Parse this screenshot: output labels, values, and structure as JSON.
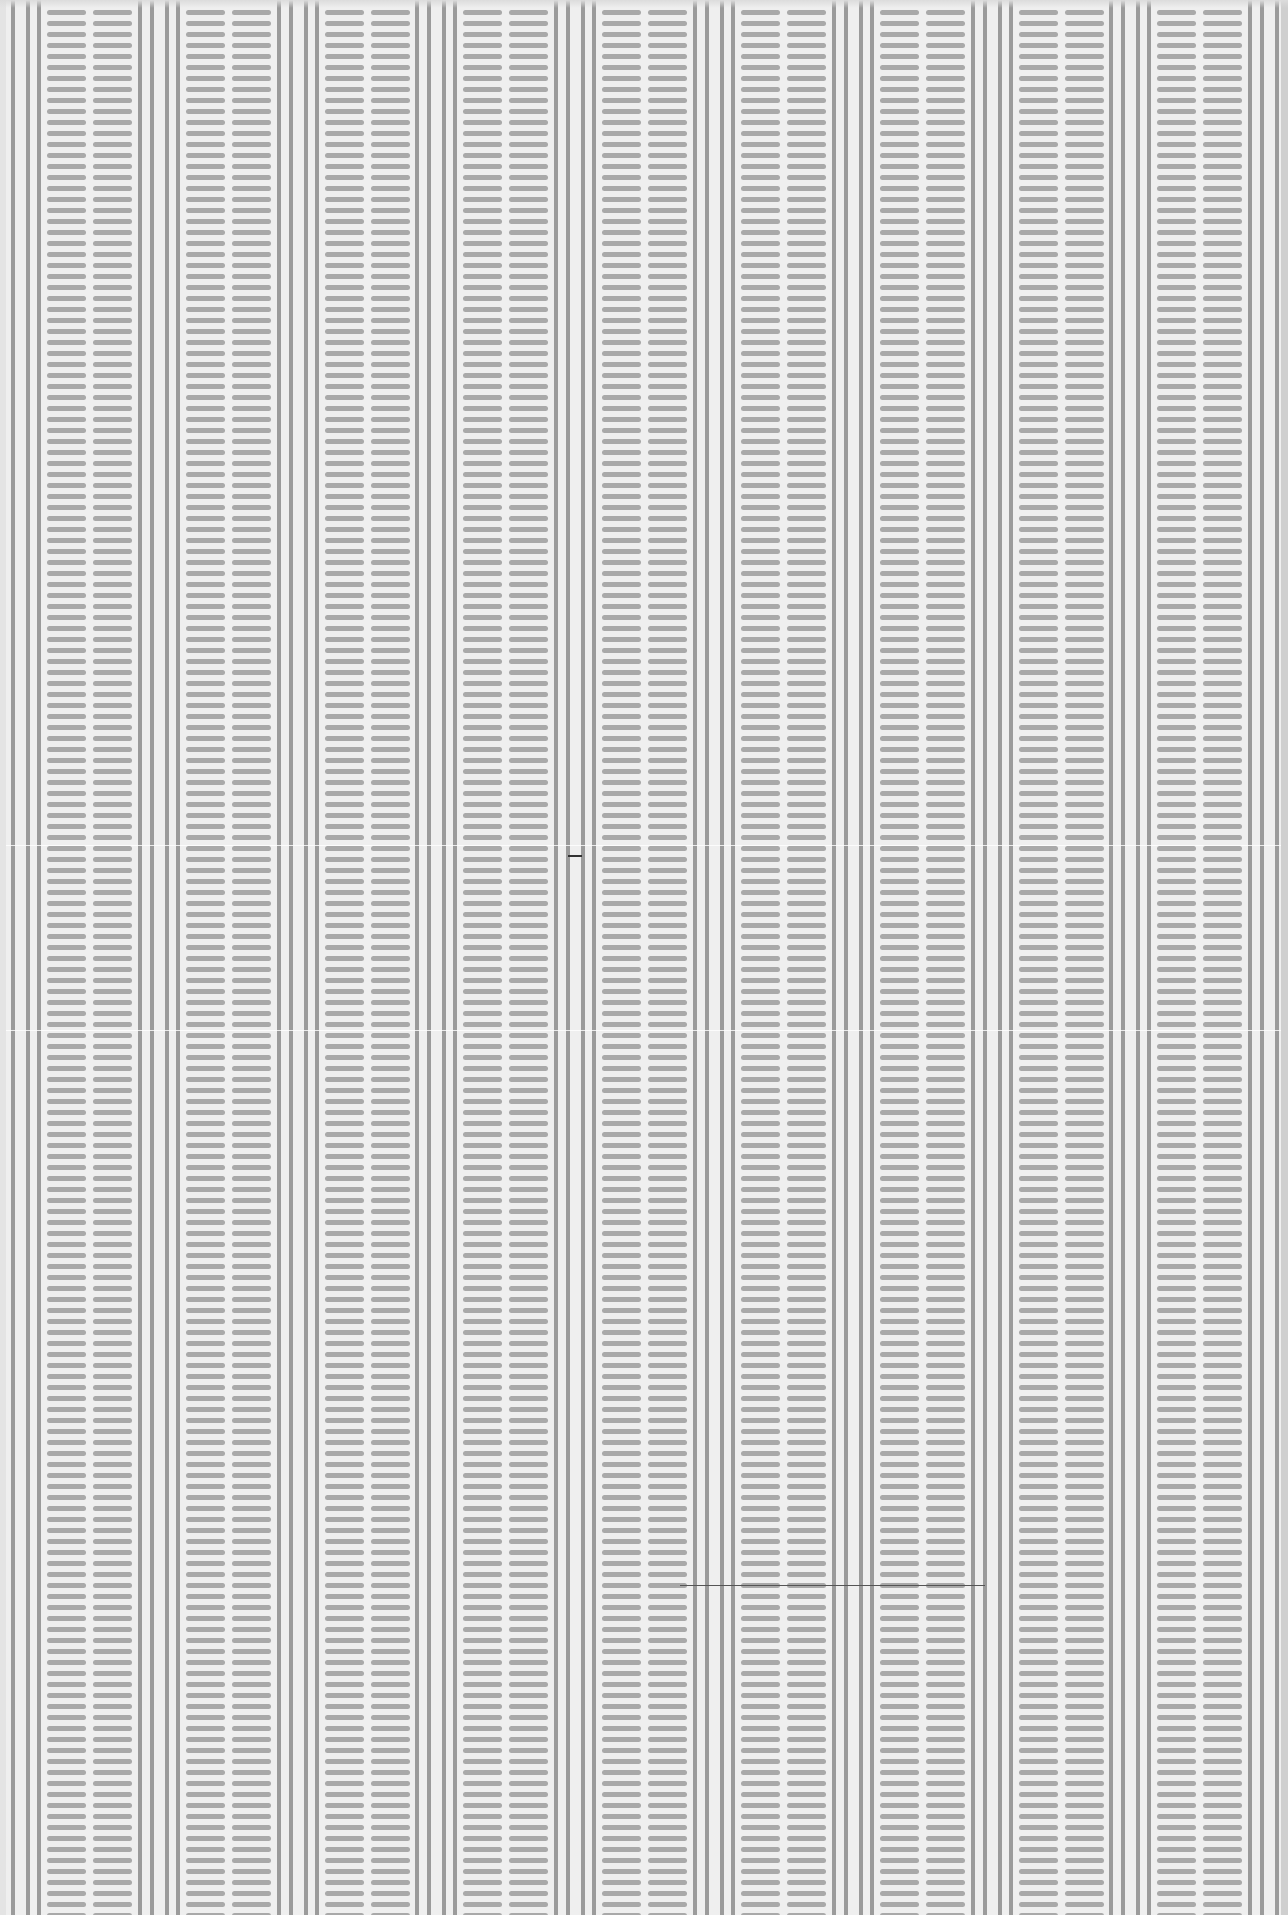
{
  "pattern": {
    "background": "#efefef",
    "line_color": "#9b9b9b",
    "dash_color": "#a9a9a9",
    "period_px": 138.8,
    "first_group_x": -1,
    "line_offsets": [
      0,
      12,
      27,
      38
    ],
    "line_width": 4,
    "dash_columns": [
      {
        "offset": 48,
        "width": 39
      },
      {
        "offset": 94,
        "width": 39
      }
    ],
    "dash_height": 5,
    "row_pitch": 11,
    "first_row_y": 10,
    "groups": 10
  },
  "artifacts": {
    "fold_lines_y": [
      845,
      1030
    ],
    "scratch": {
      "x": 680,
      "y": 1585,
      "width": 305
    },
    "mark": {
      "x": 568,
      "y": 855,
      "width": 14
    }
  }
}
